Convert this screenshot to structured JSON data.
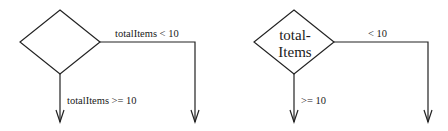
{
  "diagrams": [
    {
      "decision_text_line1": "",
      "decision_text_line2": "",
      "right_branch_label": "totalItems < 10",
      "down_branch_label": "totalItems >= 10"
    },
    {
      "decision_text_line1": "total-",
      "decision_text_line2": "Items",
      "right_branch_label": "< 10",
      "down_branch_label": ">= 10"
    }
  ],
  "colors": {
    "stroke": "#222222",
    "text": "#1a1a1a",
    "background": "#ffffff"
  }
}
